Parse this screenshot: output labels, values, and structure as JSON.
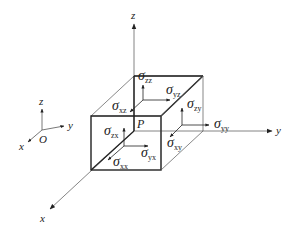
{
  "figure": {
    "type": "stress-element-diagram"
  },
  "small_axes": {
    "origin_label": "O",
    "x_label": "x",
    "y_label": "y",
    "z_label": "z"
  },
  "main_axes": {
    "x_label": "x",
    "y_label": "y",
    "z_label": "z"
  },
  "point_label": "P",
  "stresses": [
    {
      "symbol": "σ",
      "sub": "zz"
    },
    {
      "symbol": "σ",
      "sub": "yz"
    },
    {
      "symbol": "σ",
      "sub": "xz"
    },
    {
      "symbol": "σ",
      "sub": "zy"
    },
    {
      "symbol": "σ",
      "sub": "zx"
    },
    {
      "symbol": "σ",
      "sub": "yy"
    },
    {
      "symbol": "σ",
      "sub": "yx"
    },
    {
      "symbol": "σ",
      "sub": "xy"
    },
    {
      "symbol": "σ",
      "sub": "xx"
    }
  ],
  "colors": {
    "line": "#333333",
    "thin_line": "#666666",
    "text": "#222222",
    "background": "#ffffff"
  }
}
